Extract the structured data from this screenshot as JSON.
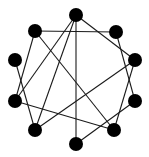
{
  "diagram": {
    "type": "graph",
    "layout": "circular",
    "node_color": "#000000",
    "edge_color": "#1a1a1a",
    "node_radius": 7,
    "nodes": [
      {
        "id": "n0",
        "x": 76,
        "y": 15
      },
      {
        "id": "n1",
        "x": 116,
        "y": 32
      },
      {
        "id": "n2",
        "x": 135,
        "y": 60
      },
      {
        "id": "n3",
        "x": 135,
        "y": 101
      },
      {
        "id": "n4",
        "x": 114,
        "y": 130
      },
      {
        "id": "n5",
        "x": 76,
        "y": 144
      },
      {
        "id": "n6",
        "x": 35,
        "y": 130
      },
      {
        "id": "n7",
        "x": 15,
        "y": 101
      },
      {
        "id": "n8",
        "x": 15,
        "y": 60
      },
      {
        "id": "n9",
        "x": 35,
        "y": 31
      }
    ],
    "edges": [
      [
        "n9",
        "n1"
      ],
      [
        "n0",
        "n2"
      ],
      [
        "n0",
        "n5"
      ],
      [
        "n0",
        "n7"
      ],
      [
        "n0",
        "n6"
      ],
      [
        "n9",
        "n7"
      ],
      [
        "n9",
        "n4"
      ],
      [
        "n1",
        "n3"
      ],
      [
        "n2",
        "n6"
      ],
      [
        "n2",
        "n4"
      ],
      [
        "n8",
        "n6"
      ],
      [
        "n7",
        "n4"
      ],
      [
        "n3",
        "n5"
      ]
    ]
  }
}
